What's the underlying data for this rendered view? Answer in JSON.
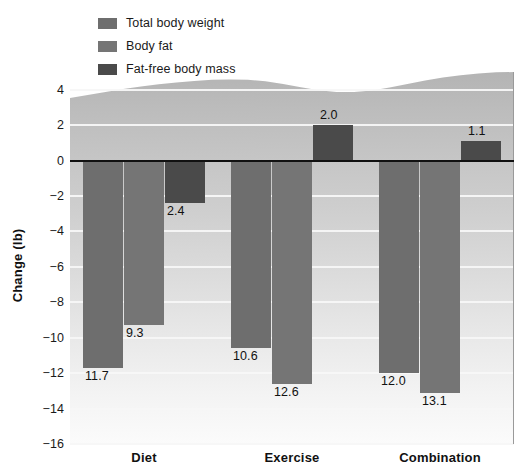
{
  "chart_data": {
    "type": "bar",
    "title": "",
    "xlabel": "",
    "ylabel": "Change (lb)",
    "categories": [
      "Diet",
      "Exercise",
      "Combination"
    ],
    "series": [
      {
        "name": "Total body weight",
        "color": "#6e6e6e",
        "values": [
          -11.7,
          -10.6,
          -12.0
        ],
        "labels": [
          "11.7",
          "10.6",
          "12.0"
        ]
      },
      {
        "name": "Body fat",
        "color": "#757575",
        "values": [
          -9.3,
          -12.6,
          -13.1
        ],
        "labels": [
          "9.3",
          "12.6",
          "13.1"
        ]
      },
      {
        "name": "Fat-free body mass",
        "color": "#4a4a4a",
        "values": [
          -2.4,
          2.0,
          1.1
        ],
        "labels": [
          "2.4",
          "2.0",
          "1.1"
        ]
      }
    ],
    "ylim": [
      -16,
      5
    ],
    "yticks": [
      "4",
      "2",
      "0",
      "−2",
      "−4",
      "−6",
      "−8",
      "−10",
      "−12",
      "−14",
      "−16"
    ],
    "ytick_values": [
      4,
      2,
      0,
      -2,
      -4,
      -6,
      -8,
      -10,
      -12,
      -14,
      -16
    ],
    "grid": true,
    "legend_position": "top-left",
    "zero_line": true
  },
  "legend": {
    "items": [
      {
        "label": "Total body weight",
        "color": "#6e6e6e"
      },
      {
        "label": "Body fat",
        "color": "#757575"
      },
      {
        "label": "Fat-free body mass",
        "color": "#4a4a4a"
      }
    ]
  }
}
